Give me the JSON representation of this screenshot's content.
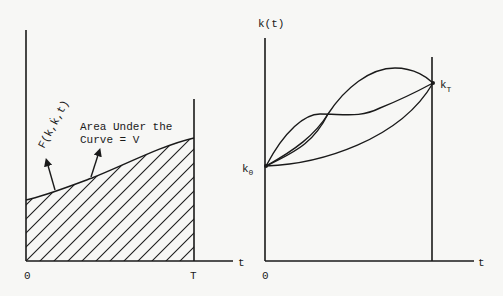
{
  "left_panel": {
    "x_axis_label": "t",
    "origin_label": "0",
    "end_label": "T",
    "curve_label": "F(k,k̇,t)",
    "area_label_line1": "Area Under the",
    "area_label_line2": "Curve = V",
    "hatched_region": "area under curve from 0 to T"
  },
  "right_panel": {
    "y_axis_label": "k(t)",
    "x_axis_label": "t",
    "origin_label": "0",
    "start_point_label": "k",
    "start_point_subscript": "0",
    "end_point_label": "k",
    "end_point_subscript": "T",
    "paths_count": 4
  },
  "colors": {
    "ink": "#1a1a1a",
    "background": "#f7f7f5"
  }
}
